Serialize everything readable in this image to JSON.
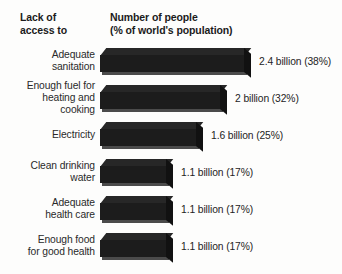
{
  "header": {
    "left": "Lack of\naccess to",
    "right": "Number of people\n(% of world's population)"
  },
  "chart_data": {
    "type": "bar",
    "orientation": "horizontal",
    "title": "Number of people (% of world's population)",
    "xlabel": "",
    "ylabel": "Lack of access to",
    "grid": false,
    "legend": null,
    "xlim": [
      0,
      2.4
    ],
    "categories": [
      "Adequate\nsanitation",
      "Enough fuel for\nheating and\ncooking",
      "Electricity",
      "Clean drinking\nwater",
      "Adequate\nhealth care",
      "Enough food\nfor good health"
    ],
    "values": [
      2.4,
      2,
      1.6,
      1.1,
      1.1,
      1.1
    ],
    "percents": [
      38,
      32,
      25,
      17,
      17,
      17
    ],
    "value_labels": [
      "2.4 billion (38%)",
      "2 billion (32%)",
      "1.6 billion (25%)",
      "1.1 billion (17%)",
      "1.1 billion (17%)",
      "1.1 billion (17%)"
    ],
    "units": "billion people",
    "bar_color": "#1c1c1c",
    "background_color": "#fdfdfc"
  },
  "rows": [
    {
      "label": "Adequate\nsanitation",
      "value_label": "2.4 billion (38%)",
      "bar_px": 145,
      "top_px": 44
    },
    {
      "label": "Enough fuel for\nheating and\ncooking",
      "value_label": "2 billion (32%)",
      "bar_px": 121,
      "top_px": 81
    },
    {
      "label": "Electricity",
      "value_label": "1.6 billion (25%)",
      "bar_px": 97,
      "top_px": 118
    },
    {
      "label": "Clean drinking\nwater",
      "value_label": "1.1 billion (17%)",
      "bar_px": 67,
      "top_px": 155
    },
    {
      "label": "Adequate\nhealth care",
      "value_label": "1.1 billion (17%)",
      "bar_px": 67,
      "top_px": 192
    },
    {
      "label": "Enough food\nfor good health",
      "value_label": "1.1 billion (17%)",
      "bar_px": 67,
      "top_px": 229
    }
  ]
}
